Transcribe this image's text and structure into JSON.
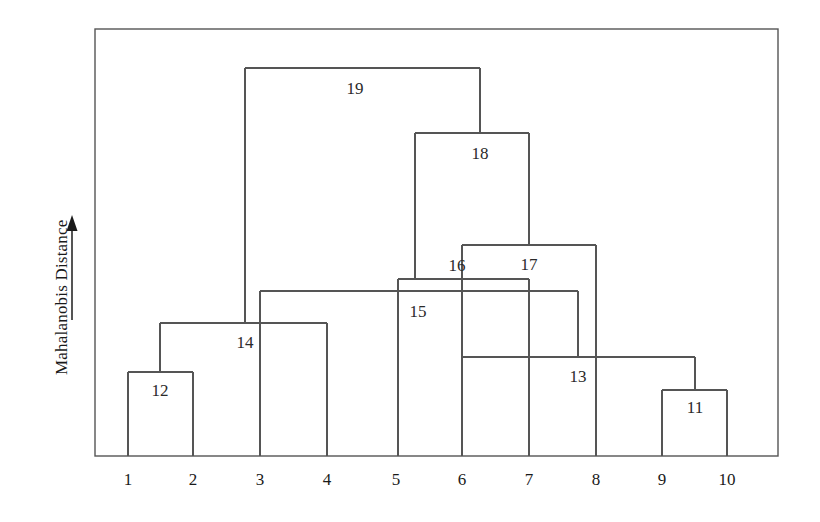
{
  "figure": {
    "background_color": "#ffffff",
    "line_color": "#555555",
    "text_color": "#1a1a1a"
  },
  "axis": {
    "y_title": "Mahalanobis Distance",
    "y_arrow_name": "up-arrow-icon",
    "frame": {
      "left": 95,
      "top": 29,
      "right": 778,
      "bottom": 456
    }
  },
  "chart_data": {
    "type": "dendrogram",
    "title": "",
    "xlabel": "",
    "ylabel": "Mahalanobis Distance",
    "orientation": "vertical",
    "y_axis": {
      "labeled_ticks": false,
      "direction": "increasing-upward",
      "arrow": true
    },
    "grid": false,
    "legend": null,
    "leaves": [
      {
        "id": "1",
        "x": 128
      },
      {
        "id": "2",
        "x": 193
      },
      {
        "id": "3",
        "x": 260
      },
      {
        "id": "4",
        "x": 327
      },
      {
        "id": "5",
        "x": 396
      },
      {
        "id": "6",
        "x": 462
      },
      {
        "id": "7",
        "x": 529
      },
      {
        "id": "8",
        "x": 596
      },
      {
        "id": "9",
        "x": 662
      },
      {
        "id": "10",
        "x": 727
      }
    ],
    "merge_nodes": [
      {
        "id": "11",
        "y": 390,
        "left_x": 662,
        "right_x": 727,
        "left_child": "9",
        "right_child": "10",
        "stem_x": 695,
        "stem_to_y": 357,
        "label_x": 695,
        "label_y": 408
      },
      {
        "id": "12",
        "y": 372,
        "left_x": 128,
        "right_x": 193,
        "left_child": "1",
        "right_child": "2",
        "stem_x": 160,
        "stem_to_y": 323,
        "label_x": 160,
        "label_y": 391
      },
      {
        "id": "13",
        "y": 357,
        "left_x": 462,
        "right_x": 695,
        "left_child": "6",
        "right_child": "11",
        "stem_x": 578,
        "stem_to_y": 291,
        "label_x": 578,
        "label_y": 377
      },
      {
        "id": "14",
        "y": 323,
        "left_x": 160,
        "right_x": 327,
        "left_child": "12",
        "right_child": "4",
        "stem_x": 245,
        "stem_to_y": 68,
        "label_x": 245,
        "label_y": 343
      },
      {
        "id": "15",
        "y": 291,
        "left_x": 260,
        "right_x": 578,
        "left_child": "3",
        "right_child": "13",
        "stem_x": 398,
        "stem_to_y": 279,
        "label_x": 418,
        "label_y": 312
      },
      {
        "id": "16",
        "y": 279,
        "left_x": 398,
        "right_x": 529,
        "left_child": "15",
        "right_child": "7",
        "stem_x": 415,
        "stem_to_y": 133,
        "label_x": 457,
        "label_y": 266
      },
      {
        "id": "17",
        "y": 245,
        "left_x": 462,
        "right_x": 596,
        "left_child": "13",
        "right_child": "8",
        "stem_x": 529,
        "stem_to_y": 133,
        "label_x": 529,
        "label_y": 265
      },
      {
        "id": "18",
        "y": 133,
        "left_x": 415,
        "right_x": 529,
        "left_child": "16",
        "right_child": "17",
        "stem_x": 480,
        "stem_to_y": 68,
        "label_x": 480,
        "label_y": 154
      },
      {
        "id": "19",
        "y": 68,
        "left_x": 245,
        "right_x": 480,
        "left_child": "14",
        "right_child": "18",
        "stem_x": null,
        "stem_to_y": null,
        "label_x": 355,
        "label_y": 89
      }
    ],
    "leaf_stems": [
      {
        "leaf": "1",
        "x": 128,
        "from_y": 456,
        "to_y": 372
      },
      {
        "leaf": "2",
        "x": 193,
        "from_y": 456,
        "to_y": 372
      },
      {
        "leaf": "3",
        "x": 260,
        "from_y": 456,
        "to_y": 291
      },
      {
        "leaf": "4",
        "x": 327,
        "from_y": 456,
        "to_y": 323
      },
      {
        "leaf": "5",
        "x": 398,
        "from_y": 456,
        "to_y": 279
      },
      {
        "leaf": "6",
        "x": 462,
        "from_y": 456,
        "to_y": 245
      },
      {
        "leaf": "7",
        "x": 529,
        "from_y": 456,
        "to_y": 279
      },
      {
        "leaf": "8",
        "x": 596,
        "from_y": 456,
        "to_y": 245
      },
      {
        "leaf": "9",
        "x": 662,
        "from_y": 456,
        "to_y": 390
      },
      {
        "leaf": "10",
        "x": 727,
        "from_y": 456,
        "to_y": 390
      }
    ],
    "node_labels": [
      "11",
      "12",
      "13",
      "14",
      "15",
      "16",
      "17",
      "18",
      "19"
    ],
    "leaf_labels": [
      "1",
      "2",
      "3",
      "4",
      "5",
      "6",
      "7",
      "8",
      "9",
      "10"
    ],
    "leaf_label_y": 470
  }
}
